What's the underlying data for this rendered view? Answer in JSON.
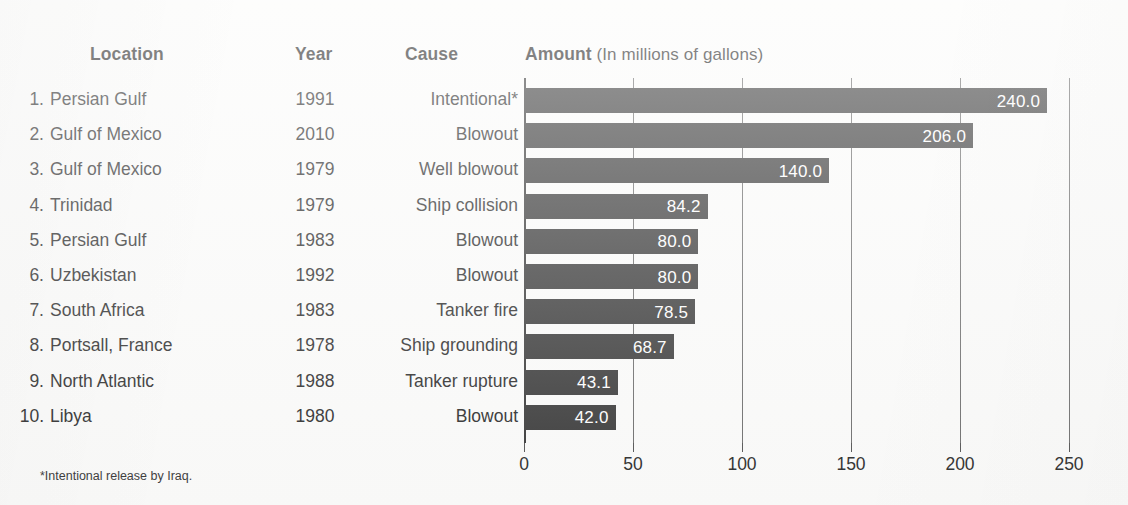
{
  "table": {
    "headers": {
      "location": "Location",
      "year": "Year",
      "cause": "Cause",
      "amount": "Amount",
      "amount_sub": " (In millions of gallons)"
    },
    "rows": [
      {
        "rank": "1.",
        "location": "Persian Gulf",
        "year": "1991",
        "cause": "Intentional*",
        "amount": 240.0,
        "amount_label": "240.0"
      },
      {
        "rank": "2.",
        "location": "Gulf of Mexico",
        "year": "2010",
        "cause": "Blowout",
        "amount": 206.0,
        "amount_label": "206.0"
      },
      {
        "rank": "3.",
        "location": "Gulf of Mexico",
        "year": "1979",
        "cause": "Well blowout",
        "amount": 140.0,
        "amount_label": "140.0"
      },
      {
        "rank": "4.",
        "location": "Trinidad",
        "year": "1979",
        "cause": "Ship collision",
        "amount": 84.2,
        "amount_label": "84.2"
      },
      {
        "rank": "5.",
        "location": "Persian Gulf",
        "year": "1983",
        "cause": "Blowout",
        "amount": 80.0,
        "amount_label": "80.0"
      },
      {
        "rank": "6.",
        "location": "Uzbekistan",
        "year": "1992",
        "cause": "Blowout",
        "amount": 80.0,
        "amount_label": "80.0"
      },
      {
        "rank": "7.",
        "location": "South Africa",
        "year": "1983",
        "cause": "Tanker fire",
        "amount": 78.5,
        "amount_label": "78.5"
      },
      {
        "rank": "8.",
        "location": "Portsall, France",
        "year": "1978",
        "cause": "Ship grounding",
        "amount": 68.7,
        "amount_label": "68.7"
      },
      {
        "rank": "9.",
        "location": "North Atlantic",
        "year": "1988",
        "cause": "Tanker rupture",
        "amount": 43.1,
        "amount_label": "43.1"
      },
      {
        "rank": "10.",
        "location": "Libya",
        "year": "1980",
        "cause": "Blowout",
        "amount": 42.0,
        "amount_label": "42.0"
      }
    ]
  },
  "footnote": "*Intentional release by Iraq.",
  "colors": {
    "bar": "#3c3c3c",
    "gridline": "#6e6e6e",
    "background": "#fbfbfa",
    "text": "#2e2e2e",
    "value_label": "#ffffff"
  },
  "chart_data": {
    "type": "bar",
    "orientation": "horizontal",
    "title": "Amount (In millions of gallons)",
    "xlabel": "",
    "ylabel": "",
    "xlim": [
      0,
      250
    ],
    "xticks": [
      0,
      50,
      100,
      150,
      200,
      250
    ],
    "xtick_labels": [
      "0",
      "50",
      "100",
      "150",
      "200",
      "250"
    ],
    "grid": "vertical",
    "legend": "none",
    "categories": [
      "Persian Gulf",
      "Gulf of Mexico",
      "Gulf of Mexico",
      "Trinidad",
      "Persian Gulf",
      "Uzbekistan",
      "South Africa",
      "Portsall, France",
      "North Atlantic",
      "Libya"
    ],
    "values": [
      240.0,
      206.0,
      140.0,
      84.2,
      80.0,
      80.0,
      78.5,
      68.7,
      43.1,
      42.0
    ],
    "data_labels": [
      "240.0",
      "206.0",
      "140.0",
      "84.2",
      "80.0",
      "80.0",
      "78.5",
      "68.7",
      "43.1",
      "42.0"
    ],
    "years": [
      1991,
      2010,
      1979,
      1979,
      1983,
      1992,
      1983,
      1978,
      1988,
      1980
    ],
    "causes": [
      "Intentional*",
      "Blowout",
      "Well blowout",
      "Ship collision",
      "Blowout",
      "Blowout",
      "Tanker fire",
      "Ship grounding",
      "Tanker rupture",
      "Blowout"
    ],
    "annotations": [
      "*Intentional release by Iraq."
    ]
  }
}
